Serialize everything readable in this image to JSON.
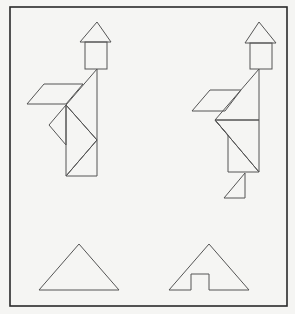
{
  "diagram": {
    "title": "",
    "colors": {
      "background": "#f5f5f3",
      "frame": "#2a2a2a",
      "stroke": "#555555"
    },
    "frame": {
      "x": 10,
      "y": 7,
      "width": 277,
      "height": 299
    },
    "figures": [
      {
        "name": "left-tangram-figure",
        "label": "",
        "house": {
          "roof": "80,42 97,22 111,42",
          "body": {
            "x": 85,
            "y": 42,
            "w": 22,
            "h": 27
          }
        },
        "pieces": [
          {
            "name": "parallelogram",
            "points": "27,104 44,84 83,84 66,104"
          },
          {
            "name": "large-triangle-upper",
            "points": "97,69 66,105 97,140"
          },
          {
            "name": "small-triangle-left",
            "points": "66,105 49,125 66,145"
          },
          {
            "name": "right-side-triangle",
            "points": "66,105 97,140 66,176"
          },
          {
            "name": "bottom-triangle",
            "points": "66,176 97,140 97,176"
          }
        ]
      },
      {
        "name": "right-tangram-figure",
        "label": "",
        "house": {
          "roof": "245,43 259,22 276,43",
          "body": {
            "x": 250,
            "y": 43,
            "w": 22,
            "h": 26
          }
        },
        "pieces": [
          {
            "name": "parallelogram",
            "points": "192,111 210,90 241,90 225,111"
          },
          {
            "name": "large-triangle-upper",
            "points": "259,69 215,120 259,120"
          },
          {
            "name": "middle-triangle",
            "points": "215,120 259,120 259,172"
          },
          {
            "name": "lower-quad",
            "points": "215,120 228,135 228,172 259,172"
          },
          {
            "name": "small-foot-triangle",
            "points": "245,173 245,198 224,198"
          }
        ]
      }
    ],
    "bottom_shapes": [
      {
        "name": "plain-triangle",
        "points": "39,290 79,244 119,290"
      },
      {
        "name": "notched-triangle",
        "points": "169,290 209,244 249,290 209,290 209,274 191,274 191,290"
      }
    ]
  }
}
